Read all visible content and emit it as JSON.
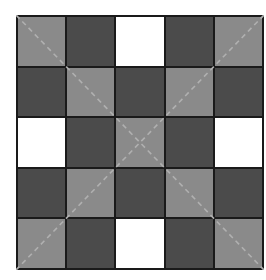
{
  "grid": {
    "rows": 5,
    "cols": 5,
    "cells": [
      [
        "L",
        "D",
        "W",
        "D",
        "L"
      ],
      [
        "D",
        "L",
        "D",
        "L",
        "D"
      ],
      [
        "W",
        "D",
        "L",
        "D",
        "W"
      ],
      [
        "D",
        "L",
        "D",
        "L",
        "D"
      ],
      [
        "L",
        "D",
        "W",
        "D",
        "L"
      ]
    ],
    "colors": {
      "D": "#4b4b4b",
      "L": "#8a8a8a",
      "W": "#ffffff",
      "line": "#1a1a1a",
      "diagonal": "#b0b0b0"
    },
    "diagonals": [
      "top-left-to-bottom-right",
      "top-right-to-bottom-left"
    ]
  }
}
